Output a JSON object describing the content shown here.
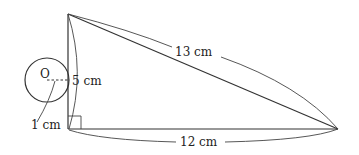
{
  "diagram": {
    "type": "geometry",
    "colors": {
      "stroke": "#333333",
      "background": "#ffffff",
      "text": "#222222"
    },
    "triangle": {
      "vertices": {
        "top": {
          "x": 68,
          "y": 14
        },
        "right_angle": {
          "x": 68,
          "y": 129
        },
        "right": {
          "x": 338,
          "y": 129
        }
      },
      "sides": {
        "vertical": {
          "label": "5 cm"
        },
        "hypotenuse": {
          "label": "13 cm"
        },
        "base": {
          "label": "12 cm"
        }
      },
      "right_angle_marker": true
    },
    "circle": {
      "center_label": "O",
      "radius_label": "1 cm",
      "center": {
        "x": 47,
        "y": 80
      },
      "radius_px": 22
    }
  }
}
